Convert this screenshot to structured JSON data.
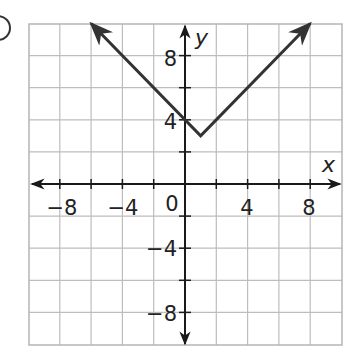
{
  "problem_marker": {
    "shape": "circle-partial"
  },
  "chart_data": {
    "type": "line",
    "title": "",
    "function": "y = |x - 1| + 3",
    "xlabel": "x",
    "ylabel": "y",
    "xlim": [
      -10,
      10
    ],
    "ylim": [
      -10,
      10
    ],
    "grid": true,
    "grid_step": 2,
    "x_ticks": [
      -8,
      -4,
      0,
      4,
      8
    ],
    "x_tick_labels": [
      "−8",
      "−4",
      "0",
      "4",
      "8"
    ],
    "y_ticks": [
      -8,
      -4,
      4,
      8
    ],
    "y_tick_labels": [
      "−8",
      "−4",
      "4",
      "8"
    ],
    "series": [
      {
        "name": "y = |x - 1| + 3",
        "color": "#333333",
        "points": [
          [
            -6,
            10
          ],
          [
            1,
            3
          ],
          [
            8,
            10
          ]
        ],
        "arrows_at_ends": true
      }
    ],
    "vertex": [
      1,
      3
    ],
    "annotations": [
      {
        "text": "4",
        "at": [
          0,
          4
        ]
      },
      {
        "text": "8",
        "at": [
          0,
          8
        ]
      }
    ]
  },
  "labels": {
    "x_axis": "x",
    "y_axis": "y",
    "origin": "0",
    "xt_m8": "−8",
    "xt_m4": "−4",
    "xt_4": "4",
    "xt_8": "8",
    "yt_8": "8",
    "yt_4": "4",
    "yt_m4": "−4",
    "yt_m8": "−8"
  },
  "colors": {
    "grid": "#bdbdbd",
    "axis": "#1a1a1a",
    "graph": "#333333",
    "text": "#222222"
  }
}
